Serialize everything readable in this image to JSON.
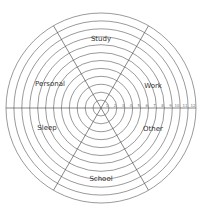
{
  "diagram": {
    "type": "life-balance-wheel",
    "center": [
      101,
      108
    ],
    "outer_radius": 95,
    "rings": 12,
    "scale_ticks": [
      "1",
      "2",
      "3",
      "4",
      "5",
      "6",
      "7",
      "8",
      "9",
      "10",
      "11",
      "12"
    ],
    "sectors": [
      {
        "label": "Study",
        "x": 101,
        "y": 41
      },
      {
        "label": "Work",
        "x": 153,
        "y": 88
      },
      {
        "label": "Other",
        "x": 153,
        "y": 131
      },
      {
        "label": "School",
        "x": 101,
        "y": 181
      },
      {
        "label": "Sleep",
        "x": 47,
        "y": 130
      },
      {
        "label": "Personal",
        "x": 50,
        "y": 86
      }
    ],
    "line_color": "#555555"
  },
  "caption": ""
}
